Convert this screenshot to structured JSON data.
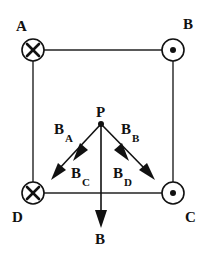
{
  "diagram": {
    "title": "",
    "corners": [
      {
        "id": "A",
        "label": "A",
        "current_direction": "into-page",
        "symbol": "cross"
      },
      {
        "id": "B",
        "label": "B",
        "current_direction": "out-of-page",
        "symbol": "dot"
      },
      {
        "id": "C",
        "label": "C",
        "current_direction": "out-of-page",
        "symbol": "dot"
      },
      {
        "id": "D",
        "label": "D",
        "current_direction": "into-page",
        "symbol": "cross"
      }
    ],
    "point": {
      "label": "P"
    },
    "vectors": [
      {
        "id": "BA",
        "main": "B",
        "sub": "A"
      },
      {
        "id": "BB",
        "main": "B",
        "sub": "B"
      },
      {
        "id": "BC",
        "main": "B",
        "sub": "C"
      },
      {
        "id": "BD",
        "main": "B",
        "sub": "D"
      }
    ],
    "resultant": {
      "label": "B"
    },
    "colors": {
      "ink": "#111111",
      "background": "#ffffff"
    }
  }
}
